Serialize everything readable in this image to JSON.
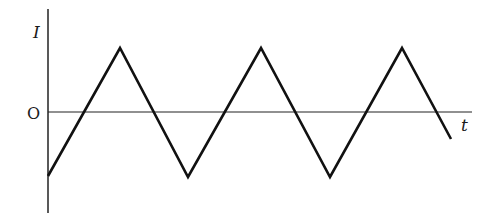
{
  "diagram": {
    "title": "",
    "type": "triangular-waveform",
    "y_axis_label": "I",
    "x_axis_label": "t",
    "origin_label": "O",
    "colors": {
      "line": "#111111",
      "axis": "#222222",
      "background": "#ffffff"
    },
    "waveform_points": [
      [
        48,
        176
      ],
      [
        120,
        48
      ],
      [
        188,
        177
      ],
      [
        261,
        48
      ],
      [
        330,
        177
      ],
      [
        402,
        48
      ],
      [
        451,
        139
      ]
    ],
    "axes": {
      "vertical": {
        "x": 48,
        "y1": 9,
        "y2": 213
      },
      "horizontal": {
        "y": 112,
        "x1": 48,
        "x2": 472
      }
    }
  }
}
